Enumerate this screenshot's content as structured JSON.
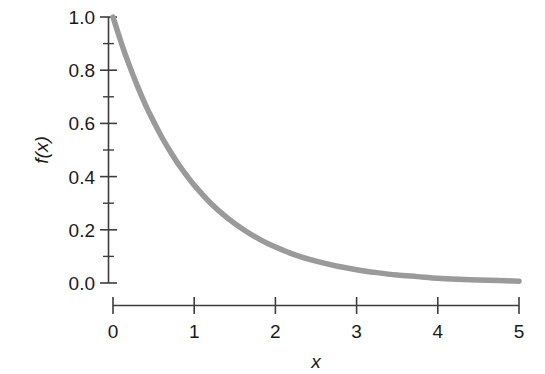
{
  "chart_data": {
    "type": "line",
    "title": "",
    "subtitle": "",
    "xlabel": "x",
    "ylabel": "f(x)",
    "xlim": [
      0,
      5
    ],
    "ylim": [
      0.0,
      1.0
    ],
    "grid": false,
    "legend": null,
    "legend_position": "none",
    "x_ticks": [
      "0",
      "1",
      "2",
      "3",
      "4",
      "5"
    ],
    "x_tick_values": [
      0,
      1,
      2,
      3,
      4,
      5
    ],
    "y_ticks": [
      "0.0",
      "0.2",
      "0.4",
      "0.6",
      "0.8",
      "1.0"
    ],
    "y_tick_values": [
      0.0,
      0.2,
      0.4,
      0.6,
      0.8,
      1.0
    ],
    "y_minor_tick_values": [
      0.1,
      0.3,
      0.5,
      0.7,
      0.9
    ],
    "series": [
      {
        "name": "f(x)",
        "color": "#9a9a9a",
        "line_width": 5.5,
        "x": [
          0.0,
          0.1,
          0.2,
          0.3,
          0.4,
          0.5,
          0.6,
          0.7,
          0.8,
          0.9,
          1.0,
          1.2,
          1.4,
          1.6,
          1.8,
          2.0,
          2.25,
          2.5,
          2.75,
          3.0,
          3.25,
          3.5,
          3.75,
          4.0,
          4.25,
          4.5,
          4.75,
          5.0
        ],
        "values": [
          1.0,
          0.905,
          0.819,
          0.741,
          0.67,
          0.607,
          0.549,
          0.497,
          0.449,
          0.407,
          0.368,
          0.301,
          0.247,
          0.202,
          0.165,
          0.135,
          0.105,
          0.082,
          0.064,
          0.05,
          0.039,
          0.03,
          0.024,
          0.018,
          0.014,
          0.011,
          0.009,
          0.007
        ]
      }
    ]
  },
  "figure": {
    "background_color": "#ffffff",
    "axis_color": "#3d3d3d",
    "text_color": "#1a1a1a",
    "curve_color": "#9a9a9a"
  }
}
